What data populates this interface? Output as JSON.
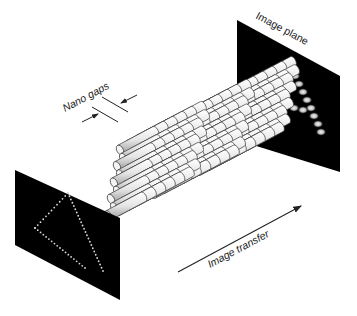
{
  "diagram": {
    "type": "schematic",
    "labels": {
      "nano_gaps": "Nano gaps",
      "image_plane": "Image plane",
      "image_transfer": "Image transfer"
    },
    "colors": {
      "panel": "#000000",
      "fiber_fill": "#e6e6e6",
      "fiber_stroke": "#333333",
      "input_dots": "#d8d8d8",
      "output_spots": "#cfcfcf",
      "text": "#222222"
    },
    "nodes": [
      {
        "id": "input-panel",
        "label": "",
        "content": "dotted triangle (letter A-like shape)"
      },
      {
        "id": "fiber-bundle",
        "label": "",
        "content": "hexagonally packed cylindrical fibers in three blocks"
      },
      {
        "id": "image-plane",
        "label": "Image plane",
        "content": "blurred spots forming triangle"
      }
    ],
    "edges": [
      {
        "from": "input-panel",
        "to": "image-plane",
        "label": "Image transfer",
        "style": "arrow"
      }
    ]
  }
}
